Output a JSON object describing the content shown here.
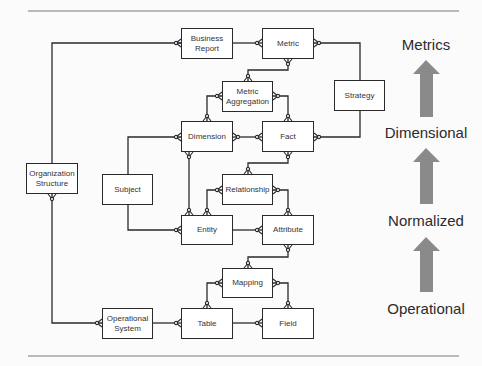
{
  "diagram": {
    "entities": [
      {
        "id": "business_report",
        "label": "Business Report",
        "x": 181,
        "y": 28,
        "w": 52,
        "h": 31
      },
      {
        "id": "metric",
        "label": "Metric",
        "x": 262,
        "y": 28,
        "w": 52,
        "h": 31
      },
      {
        "id": "metric_aggregation",
        "label": "Metric Aggregation",
        "x": 222,
        "y": 81,
        "w": 51,
        "h": 31
      },
      {
        "id": "strategy",
        "label": "Strategy",
        "x": 334,
        "y": 80,
        "w": 51,
        "h": 31
      },
      {
        "id": "dimension",
        "label": "Dimension",
        "x": 181,
        "y": 121,
        "w": 52,
        "h": 31
      },
      {
        "id": "fact",
        "label": "Fact",
        "x": 262,
        "y": 121,
        "w": 52,
        "h": 31
      },
      {
        "id": "organization_structure",
        "label": "Organization Structure",
        "x": 26,
        "y": 163,
        "w": 52,
        "h": 31
      },
      {
        "id": "subject",
        "label": "Subject",
        "x": 102,
        "y": 174,
        "w": 51,
        "h": 31
      },
      {
        "id": "relationship",
        "label": "Relationship",
        "x": 222,
        "y": 174,
        "w": 51,
        "h": 31
      },
      {
        "id": "entity",
        "label": "Entity",
        "x": 181,
        "y": 215,
        "w": 52,
        "h": 30
      },
      {
        "id": "attribute",
        "label": "Attribute",
        "x": 262,
        "y": 215,
        "w": 52,
        "h": 30
      },
      {
        "id": "mapping",
        "label": "Mapping",
        "x": 222,
        "y": 268,
        "w": 51,
        "h": 30
      },
      {
        "id": "operational_system",
        "label": "Operational System",
        "x": 102,
        "y": 308,
        "w": 51,
        "h": 31
      },
      {
        "id": "table",
        "label": "Table",
        "x": 181,
        "y": 308,
        "w": 52,
        "h": 31
      },
      {
        "id": "field",
        "label": "Field",
        "x": 262,
        "y": 308,
        "w": 52,
        "h": 31
      }
    ],
    "levels": [
      {
        "label": "Metrics",
        "x": 433,
        "y": 9
      },
      {
        "label": "Dimensional",
        "x": 426,
        "y": 126
      },
      {
        "label": "Normalized",
        "x": 426,
        "y": 212
      },
      {
        "label": "Operational",
        "x": 426,
        "y": 300
      }
    ],
    "arrow_color": "#8a8a8a",
    "line_color": "#2a2a2a",
    "rule_color": "#7a7a7a"
  }
}
